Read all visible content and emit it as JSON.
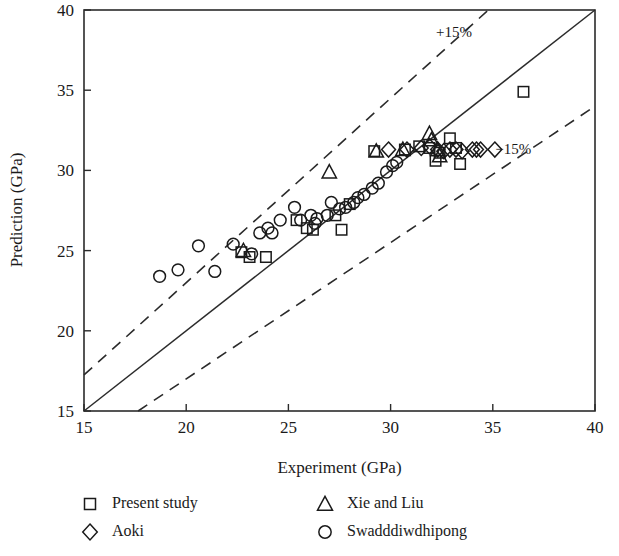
{
  "chart_data": {
    "type": "scatter",
    "title": "",
    "xlabel": "Experiment (GPa)",
    "ylabel": "Prediction (GPa)",
    "xlim": [
      15,
      40
    ],
    "ylim": [
      15,
      40
    ],
    "xticks": [
      15,
      20,
      25,
      30,
      35,
      40
    ],
    "yticks": [
      15,
      20,
      25,
      30,
      35,
      40
    ],
    "grid": false,
    "legend_position": "below-plot",
    "reference_lines": [
      {
        "name": "identity",
        "label": "",
        "style": "solid",
        "slope": 1.0,
        "intercept": 0
      },
      {
        "name": "plus15",
        "label": "+15%",
        "style": "dashed",
        "slope": 1.15,
        "intercept": 0
      },
      {
        "name": "minus15",
        "label": "−15%",
        "style": "dashed",
        "slope": 0.85,
        "intercept": 0
      }
    ],
    "annotations": [
      {
        "text": "+15%",
        "x": 33.1,
        "y": 38.3
      },
      {
        "text": "−15%",
        "x": 36.0,
        "y": 31.0
      }
    ],
    "series": [
      {
        "name": "Present study",
        "marker": "square",
        "points": [
          [
            22.7,
            24.9
          ],
          [
            23.1,
            24.6
          ],
          [
            23.9,
            24.6
          ],
          [
            25.4,
            26.9
          ],
          [
            25.9,
            26.4
          ],
          [
            26.2,
            26.3
          ],
          [
            27.3,
            27.2
          ],
          [
            27.6,
            26.3
          ],
          [
            28.0,
            27.9
          ],
          [
            29.2,
            31.2
          ],
          [
            30.7,
            31.3
          ],
          [
            31.4,
            31.5
          ],
          [
            31.9,
            31.4
          ],
          [
            32.2,
            30.6
          ],
          [
            32.4,
            31.1
          ],
          [
            32.9,
            32.0
          ],
          [
            33.2,
            31.4
          ],
          [
            33.4,
            30.4
          ],
          [
            36.5,
            34.9
          ]
        ]
      },
      {
        "name": "Aoki",
        "marker": "diamond",
        "points": [
          [
            29.9,
            31.3
          ],
          [
            30.8,
            31.3
          ],
          [
            31.5,
            31.4
          ],
          [
            31.9,
            31.5
          ],
          [
            32.3,
            31.3
          ],
          [
            32.6,
            31.2
          ],
          [
            32.9,
            31.3
          ],
          [
            33.2,
            31.3
          ],
          [
            33.5,
            31.2
          ],
          [
            34.0,
            31.3
          ],
          [
            34.2,
            31.3
          ],
          [
            34.4,
            31.3
          ],
          [
            35.1,
            31.3
          ]
        ]
      },
      {
        "name": "Xie and Liu",
        "marker": "triangle",
        "points": [
          [
            22.8,
            25.0
          ],
          [
            27.0,
            29.9
          ],
          [
            29.3,
            31.2
          ],
          [
            30.6,
            31.3
          ],
          [
            31.9,
            32.3
          ],
          [
            32.0,
            31.9
          ],
          [
            32.3,
            31.3
          ],
          [
            32.4,
            30.9
          ]
        ]
      },
      {
        "name": "Swadddiwdhipong",
        "marker": "circle",
        "points": [
          [
            18.7,
            23.4
          ],
          [
            19.6,
            23.8
          ],
          [
            20.6,
            25.3
          ],
          [
            21.4,
            23.7
          ],
          [
            22.3,
            25.4
          ],
          [
            23.2,
            24.8
          ],
          [
            23.6,
            26.1
          ],
          [
            24.0,
            26.4
          ],
          [
            24.2,
            26.1
          ],
          [
            24.6,
            26.9
          ],
          [
            25.3,
            27.7
          ],
          [
            25.6,
            26.9
          ],
          [
            26.1,
            27.2
          ],
          [
            26.3,
            26.7
          ],
          [
            26.4,
            27.0
          ],
          [
            26.9,
            27.2
          ],
          [
            27.1,
            28.0
          ],
          [
            27.5,
            27.6
          ],
          [
            27.8,
            27.7
          ],
          [
            28.2,
            28.0
          ],
          [
            28.4,
            28.3
          ],
          [
            28.7,
            28.5
          ],
          [
            29.1,
            28.9
          ],
          [
            29.4,
            29.2
          ],
          [
            29.8,
            29.9
          ],
          [
            30.1,
            30.3
          ],
          [
            30.3,
            30.5
          ]
        ]
      }
    ]
  },
  "legend": {
    "entries": [
      {
        "label": "Present study",
        "marker": "square"
      },
      {
        "label": "Aoki",
        "marker": "diamond"
      },
      {
        "label": "Xie and Liu",
        "marker": "triangle"
      },
      {
        "label": "Swadddiwdhipong",
        "marker": "circle"
      }
    ]
  }
}
